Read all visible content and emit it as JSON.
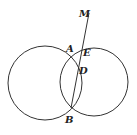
{
  "diagram": {
    "type": "two intersecting circles with secant line",
    "labels": {
      "M": "M",
      "A": "A",
      "E": "E",
      "D": "D",
      "B": "B"
    },
    "colors": {
      "stroke": "#333333",
      "text": "#222222",
      "background": "#ffffff"
    }
  }
}
